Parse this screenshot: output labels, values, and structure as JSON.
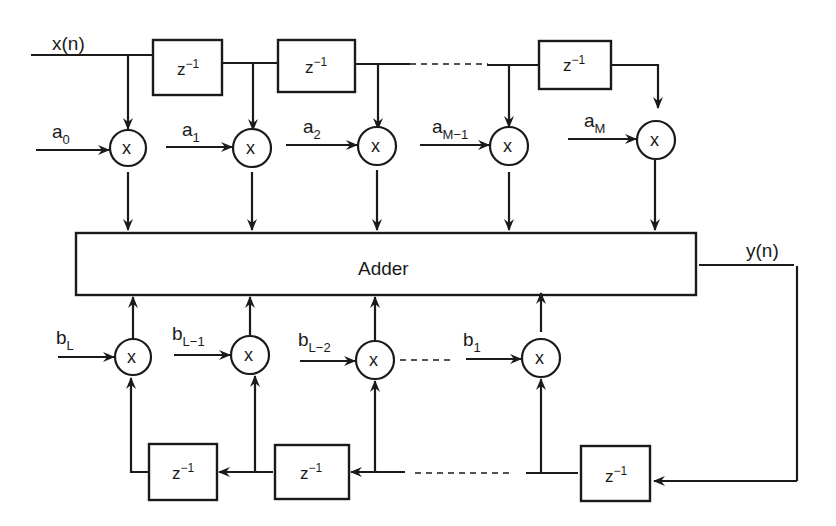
{
  "diagram": {
    "colors": {
      "stroke": "#1a1a1a",
      "background": "#ffffff"
    },
    "input": {
      "label": "x(n)"
    },
    "output": {
      "label": "y(n)"
    },
    "adder": {
      "label": "Adder"
    },
    "delay": {
      "base": "z",
      "exponent": "−1"
    },
    "multiplier_symbol": "x",
    "feedforward_coeffs": [
      {
        "base": "a",
        "sub": "0"
      },
      {
        "base": "a",
        "sub": "1"
      },
      {
        "base": "a",
        "sub": "2"
      },
      {
        "base": "a",
        "sub": "M−1"
      },
      {
        "base": "a",
        "sub": "M"
      }
    ],
    "feedback_coeffs": [
      {
        "base": "b",
        "sub": "L"
      },
      {
        "base": "b",
        "sub": "L−1"
      },
      {
        "base": "b",
        "sub": "L−2"
      },
      {
        "base": "b",
        "sub": "1"
      }
    ]
  }
}
